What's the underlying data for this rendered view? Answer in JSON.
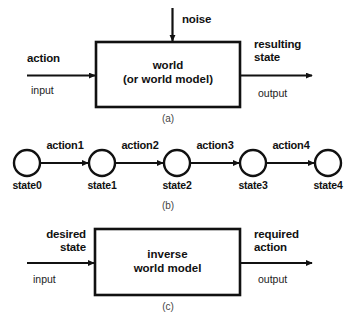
{
  "figure": {
    "background_color": "#ffffff",
    "stroke_color": "#111111"
  },
  "panel_a": {
    "tag": "(a)",
    "box_text_line1": "world",
    "box_text_line2": "(or world model)",
    "top_input_label": "noise",
    "left_label_bold": "action",
    "left_label_plain": "input",
    "right_label_bold_line1": "resulting",
    "right_label_bold_line2": "state",
    "right_label_plain": "output"
  },
  "panel_b": {
    "tag": "(b)",
    "nodes": [
      {
        "label": "state0"
      },
      {
        "label": "state1"
      },
      {
        "label": "state2"
      },
      {
        "label": "state3"
      },
      {
        "label": "state4"
      }
    ],
    "edges": [
      {
        "label": "action1"
      },
      {
        "label": "action2"
      },
      {
        "label": "action3"
      },
      {
        "label": "action4"
      }
    ]
  },
  "panel_c": {
    "tag": "(c)",
    "box_text_line1": "inverse",
    "box_text_line2": "world model",
    "left_label_bold_line1": "desired",
    "left_label_bold_line2": "state",
    "left_label_plain": "input",
    "right_label_bold_line1": "required",
    "right_label_bold_line2": "action",
    "right_label_plain": "output"
  }
}
